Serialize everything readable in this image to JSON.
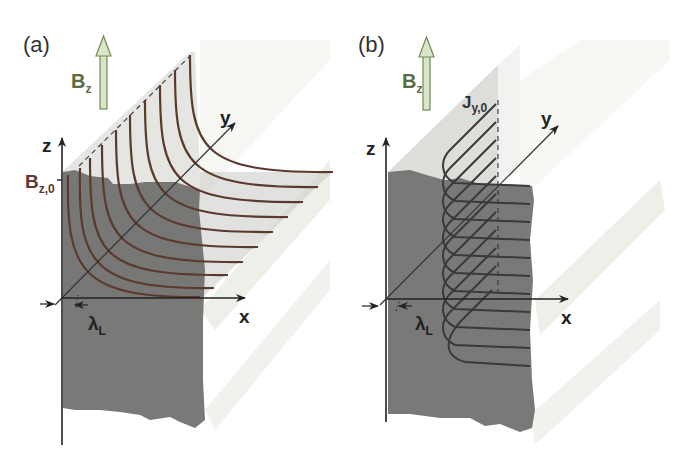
{
  "figure": {
    "panels": [
      {
        "id": "a",
        "label": "(a)",
        "field_arrow_label": "B",
        "field_arrow_sub": "z",
        "surface_value_label": "B",
        "surface_value_sub": "z,0",
        "axes": {
          "z": "z",
          "x": "x",
          "y": "y"
        },
        "penetration_depth_label": "λ",
        "penetration_depth_sub": "L",
        "curve_count": 10,
        "curve_color": "#5b3a2e"
      },
      {
        "id": "b",
        "label": "(b)",
        "field_arrow_label": "B",
        "field_arrow_sub": "z",
        "surface_value_label": "J",
        "surface_value_sub": "y,0",
        "axes": {
          "z": "z",
          "x": "x",
          "y": "y"
        },
        "penetration_depth_label": "λ",
        "penetration_depth_sub": "L",
        "curve_count": 10,
        "curve_color": "#3a3a3a"
      }
    ],
    "colors": {
      "slab_dark": "#6e6e6c",
      "plane_light": "#d8d8d4",
      "arrow_fill": "#d9e6c8",
      "arrow_stroke": "#6f8a55",
      "bz_text": "#5a6b45",
      "bz0_text": "#5a3a30"
    }
  }
}
